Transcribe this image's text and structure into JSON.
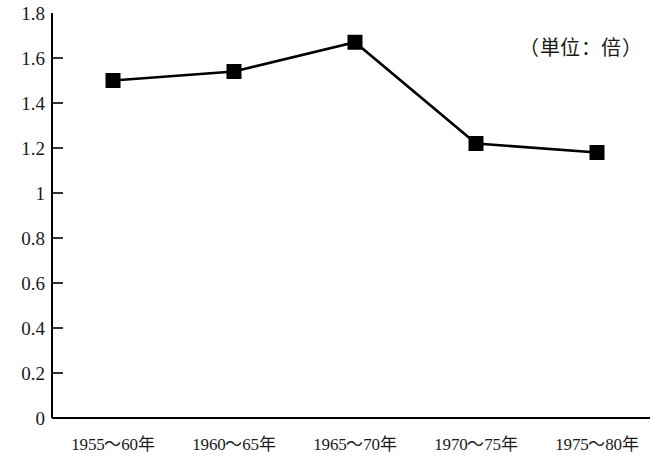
{
  "chart_data": {
    "type": "line",
    "title": "",
    "subtitle": "",
    "annotation": "（単位：倍）",
    "xlabel": "",
    "ylabel": "",
    "categories": [
      "1955〜60年",
      "1960〜65年",
      "1965〜70年",
      "1970〜75年",
      "1975〜80年"
    ],
    "values": [
      1.5,
      1.54,
      1.67,
      1.22,
      1.18
    ],
    "series": [
      {
        "name": "",
        "values": [
          1.5,
          1.54,
          1.67,
          1.22,
          1.18
        ],
        "marker": "filled-square",
        "color": "#000000"
      }
    ],
    "ylim": [
      0,
      1.8
    ],
    "ytick_values": [
      0,
      0.2,
      0.4,
      0.6,
      0.8,
      1,
      1.2,
      1.4,
      1.6,
      1.8
    ],
    "ytick_labels": [
      "0",
      "0.2",
      "0.4",
      "0.6",
      "0.8",
      "1",
      "1.2",
      "1.4",
      "1.6",
      "1.8"
    ],
    "grid": false,
    "legend": false,
    "legend_position": "none",
    "axis_color": "#000000",
    "background": "#ffffff",
    "y_ticks_inward": true,
    "x_ticks": false
  }
}
